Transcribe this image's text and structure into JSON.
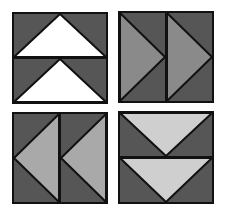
{
  "figure": {
    "colors": {
      "dark": "#565656",
      "medium": "#8a8a8a",
      "light": "#cfcfcf",
      "white": "#ffffff",
      "outline": "#111111"
    },
    "blocks": [
      {
        "id": "top-left",
        "orientation": "up",
        "goose_color": "white"
      },
      {
        "id": "top-right",
        "orientation": "right",
        "goose_color": "medium"
      },
      {
        "id": "bottom-left",
        "orientation": "left",
        "goose_color": "light"
      },
      {
        "id": "bottom-right",
        "orientation": "down",
        "goose_color": "light"
      }
    ]
  }
}
